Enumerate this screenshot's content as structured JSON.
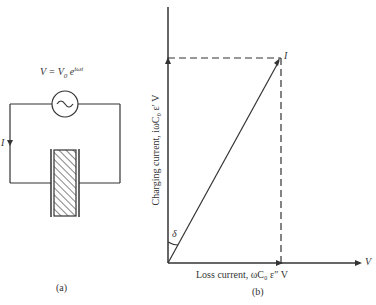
{
  "figure_a": {
    "source_label": "V = V₀ e^{iωt}",
    "source_label_main": "V = V",
    "source_label_sub": "0",
    "source_label_exp": "e",
    "source_label_sup": "iωt",
    "current_label": "I",
    "caption": "(a)"
  },
  "figure_b": {
    "y_axis_label": "Charging current, iωC₀ ε′ V",
    "x_axis_label": "Loss current, ωC₀ ε″ V",
    "point_label": "I",
    "angle_label": "δ",
    "x_end_label": "V",
    "caption": "(b)"
  },
  "colors": {
    "line": "#333333",
    "background": "#ffffff"
  }
}
